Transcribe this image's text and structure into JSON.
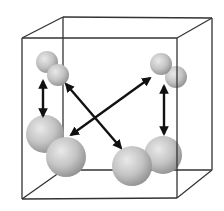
{
  "diagram": {
    "type": "3d-unit-cell",
    "background": "#ffffff",
    "cube": {
      "edge_color": "#333333",
      "front_face": {
        "tl": [
          22,
          38
        ],
        "tr": [
          177,
          38
        ],
        "br": [
          177,
          198
        ],
        "bl": [
          22,
          199
        ]
      },
      "back_face": {
        "tl": [
          63,
          17
        ],
        "tr": [
          212,
          18
        ],
        "br": [
          212,
          170
        ],
        "bl": [
          63,
          170
        ]
      }
    },
    "molecules": [
      {
        "name": "top-left-dimer",
        "size": "small",
        "spheres": [
          {
            "cx": 47,
            "cy": 62,
            "r": 11
          },
          {
            "cx": 58,
            "cy": 75,
            "r": 11
          }
        ]
      },
      {
        "name": "top-right-dimer",
        "size": "small",
        "spheres": [
          {
            "cx": 161,
            "cy": 64,
            "r": 11
          },
          {
            "cx": 176,
            "cy": 77,
            "r": 11
          }
        ]
      },
      {
        "name": "bottom-left-dimer",
        "size": "large",
        "spheres": [
          {
            "cx": 45,
            "cy": 134,
            "r": 19
          },
          {
            "cx": 66,
            "cy": 157,
            "r": 20
          }
        ]
      },
      {
        "name": "bottom-right-dimer",
        "size": "large",
        "spheres": [
          {
            "cx": 163,
            "cy": 155,
            "r": 19
          },
          {
            "cx": 132,
            "cy": 166,
            "r": 20
          }
        ]
      }
    ],
    "arrows": [
      {
        "name": "left-vertical-arrow",
        "from": [
          43,
          81
        ],
        "to": [
          43,
          116
        ],
        "double_headed": true
      },
      {
        "name": "right-vertical-arrow",
        "from": [
          164,
          86
        ],
        "to": [
          164,
          134
        ],
        "double_headed": true
      },
      {
        "name": "diagonal-arrow-down",
        "from": [
          66,
          84
        ],
        "to": [
          121,
          148
        ],
        "double_headed": true
      },
      {
        "name": "diagonal-arrow-up",
        "from": [
          150,
          78
        ],
        "to": [
          71,
          135
        ],
        "double_headed": true
      }
    ],
    "sphere_colors": {
      "highlight": "#e6e6e6",
      "mid": "#b8b8b8",
      "shadow": "#8a8a8a"
    },
    "arrow_color": "#111111"
  }
}
